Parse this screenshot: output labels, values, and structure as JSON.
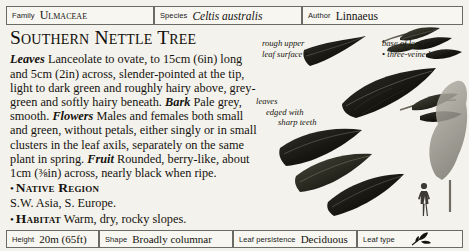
{
  "header": {
    "family": {
      "label": "Family",
      "value": "Ulmaceae"
    },
    "species": {
      "label": "Species",
      "value": "Celtis australis"
    },
    "author": {
      "label": "Author",
      "value": "Linnaeus"
    }
  },
  "main": {
    "title": "Southern Nettle Tree",
    "description": {
      "leaves_head": "Leaves",
      "leaves_text": " Lanceolate to ovate, to 15cm (6in) long and 5cm (2in) across, slender-pointed at the tip, light to dark green and roughly hairy above, grey-green and softly hairy beneath. ",
      "bark_head": "Bark",
      "bark_text": " Pale grey, smooth. ",
      "flowers_head": "Flowers",
      "flowers_text": " Males and females both small and green, without petals, either singly or in small clusters in the leaf axils, separately on the same plant in spring. ",
      "fruit_head": "Fruit",
      "fruit_text": " Rounded, berry-like, about 1cm (⅜in) across, nearly black when ripe."
    },
    "bullets": [
      {
        "bullet": "•",
        "heading": "Native Region",
        "detail": "S.W. Asia, S. Europe."
      },
      {
        "bullet": "•",
        "heading": "Habitat",
        "inline_detail": " Warm, dry, rocky slopes."
      }
    ]
  },
  "illustration": {
    "callouts": [
      {
        "line1": "rough upper",
        "line2": "leaf surface",
        "dot": "•"
      },
      {
        "line1": "base of leaf is",
        "line2": "three-veined",
        "dot": "•"
      },
      {
        "line1": "leaves",
        "line2": "edged with",
        "line3": "sharp teeth"
      }
    ]
  },
  "footer": {
    "height": {
      "label": "Height",
      "value": "20m (65ft)"
    },
    "shape": {
      "label": "Shape",
      "value": "Broadly columnar"
    },
    "persistence": {
      "label": "Leaf persistence",
      "value": "Deciduous"
    },
    "leaf_type": {
      "label": "Leaf type",
      "icon": "leaf-sprig-icon"
    }
  },
  "colors": {
    "card_background": "#f4f2ec",
    "cell_background": "#f7f6f1",
    "border": "#6b6b66",
    "text": "#15130f",
    "foliage_dark": "#1b1b17"
  }
}
